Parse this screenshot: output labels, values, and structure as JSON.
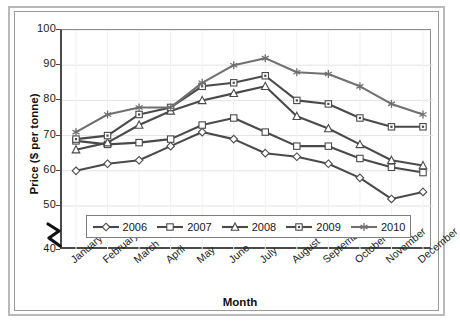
{
  "chart_data": {
    "type": "line",
    "title": "",
    "xlabel": "Month",
    "ylabel": "Price ($ per tonne)",
    "categories": [
      "January",
      "February",
      "March",
      "April",
      "May",
      "June",
      "July",
      "August",
      "September",
      "October",
      "November",
      "December"
    ],
    "yticks": [
      100,
      90,
      80,
      70,
      60,
      50,
      40
    ],
    "ylim": [
      40,
      100
    ],
    "axis_break": true,
    "axis_break_between": [
      40,
      50
    ],
    "grid": true,
    "legend_position": "inside-bottom",
    "series": [
      {
        "name": "2006",
        "marker": "diamond",
        "color": "#4a4a4a",
        "values": [
          60,
          62,
          63,
          67,
          71,
          69,
          65,
          64,
          62,
          58,
          52,
          54
        ]
      },
      {
        "name": "2007",
        "marker": "square",
        "color": "#4a4a4a",
        "values": [
          68.5,
          67.5,
          68,
          69,
          73,
          75,
          71,
          67,
          67,
          63.5,
          61,
          59.5
        ]
      },
      {
        "name": "2008",
        "marker": "triangle",
        "color": "#4a4a4a",
        "values": [
          66,
          68,
          73,
          77,
          80,
          82,
          84,
          75.5,
          72,
          67.5,
          63,
          61.5
        ]
      },
      {
        "name": "2009",
        "marker": "square-dot",
        "color": "#4a4a4a",
        "values": [
          69,
          70,
          76,
          78,
          84,
          85,
          87,
          80,
          79,
          75,
          72.5,
          72.5
        ]
      },
      {
        "name": "2010",
        "marker": "asterisk",
        "color": "#707070",
        "values": [
          71,
          76,
          78,
          78,
          85,
          90,
          92,
          88,
          87.5,
          84,
          79,
          76
        ]
      }
    ]
  },
  "axis": {
    "ylabel": "Price ($ per tonne)",
    "xlabel": "Month"
  },
  "legend": {
    "items": [
      {
        "label": "2006"
      },
      {
        "label": "2007"
      },
      {
        "label": "2008"
      },
      {
        "label": "2009"
      },
      {
        "label": "2010"
      }
    ]
  }
}
